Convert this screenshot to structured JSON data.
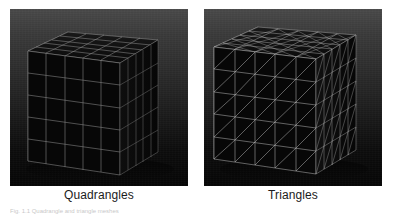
{
  "page": {
    "background_color": "#ffffff",
    "width": 393,
    "height": 215
  },
  "figure": {
    "panels": [
      {
        "id": "quadrangles",
        "caption": "Quadrangles",
        "mesh_type": "quad",
        "subdivisions": 5,
        "background_top_color": "#4a4a4a",
        "background_bottom_color": "#060606",
        "face_color": "#070707",
        "wire_color": "#b9b9b9"
      },
      {
        "id": "triangles",
        "caption": "Triangles",
        "mesh_type": "triangle",
        "subdivisions": 5,
        "background_top_color": "#4a4a4a",
        "background_bottom_color": "#060606",
        "face_color": "#070707",
        "wire_color": "#cccccc"
      }
    ],
    "caption_text": "Fig. 1.1   Quadrangle and triangle meshes"
  }
}
